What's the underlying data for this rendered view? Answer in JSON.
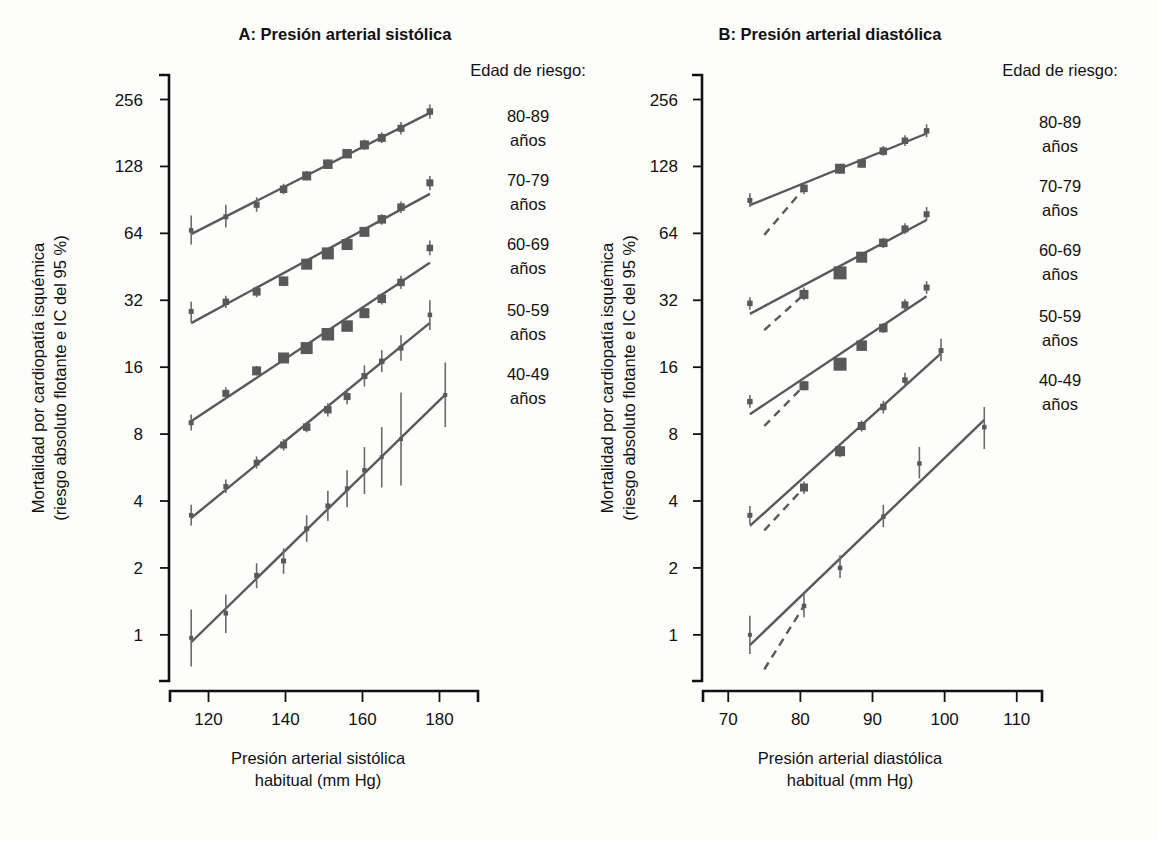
{
  "figure": {
    "background": "#fdfdfb",
    "marker_color": "#595959",
    "axis_color": "#111111"
  },
  "panels": [
    {
      "id": "A",
      "title": "A: Presión arterial sistólica",
      "xlabel_line1": "Presión arterial sistólica",
      "xlabel_line2": "habitual (mm Hg)",
      "ylabel_line1": "Mortalidad por cardiopatía isquémica",
      "ylabel_line2": "(riesgo absoluto flotante e IC del 95 %)",
      "legend_title": "Edad de riesgo:",
      "legend_items": [
        {
          "range": "80-89",
          "unit": "años"
        },
        {
          "range": "70-79",
          "unit": "años"
        },
        {
          "range": "60-69",
          "unit": "años"
        },
        {
          "range": "50-59",
          "unit": "años"
        },
        {
          "range": "40-49",
          "unit": "años"
        }
      ]
    },
    {
      "id": "B",
      "title": "B: Presión arterial diastólica",
      "xlabel_line1": "Presión arterial diastólica",
      "xlabel_line2": "habitual (mm Hg)",
      "ylabel_line1": "Mortalidad por cardiopatía isquémica",
      "ylabel_line2": "(riesgo absoluto flotante e IC del 95 %)",
      "legend_title": "Edad de riesgo:",
      "legend_items": [
        {
          "range": "80-89",
          "unit": "años"
        },
        {
          "range": "70-79",
          "unit": "años"
        },
        {
          "range": "60-69",
          "unit": "años"
        },
        {
          "range": "50-59",
          "unit": "años"
        },
        {
          "range": "40-49",
          "unit": "años"
        }
      ]
    }
  ],
  "chart_data": [
    {
      "type": "scatter",
      "panel": "A",
      "title": "A: Presión arterial sistólica",
      "xlabel": "Presión arterial sistólica habitual (mm Hg)",
      "ylabel": "Mortalidad por cardiopatía isquémica (riesgo absoluto flotante e IC del 95 %)",
      "xlim": [
        110,
        190
      ],
      "xticks": [
        120,
        140,
        160,
        180
      ],
      "ylim": [
        0.62,
        330
      ],
      "yscale": "log2",
      "yticks": [
        1,
        2,
        4,
        8,
        16,
        32,
        64,
        128,
        256
      ],
      "grid": false,
      "legend_position": "right",
      "series": [
        {
          "name": "80-89 años",
          "x": [
            115.5,
            124.5,
            132.5,
            139.5,
            145.5,
            151.0,
            156.0,
            160.5,
            165.0,
            170.0,
            177.5
          ],
          "y": [
            66,
            76,
            86,
            101,
            116,
            131,
            146,
            160,
            172,
            190,
            226
          ],
          "ci_low": [
            57,
            68,
            80,
            96,
            111,
            126,
            140,
            152,
            163,
            178,
            210
          ],
          "ci_high": [
            77,
            86,
            93,
            107,
            122,
            137,
            153,
            169,
            182,
            203,
            243
          ],
          "size": [
            4.5,
            5,
            6,
            7.5,
            9,
            9.5,
            9.5,
            9,
            8,
            7,
            6.5
          ]
        },
        {
          "name": "70-79 años",
          "x": [
            115.5,
            124.5,
            132.5,
            139.5,
            145.5,
            151.0,
            156.0,
            160.5,
            165.0,
            170.0,
            177.5
          ],
          "y": [
            28.5,
            31.5,
            35.0,
            39.0,
            46.5,
            52.0,
            57.0,
            65.0,
            74.0,
            84.0,
            108.0
          ],
          "ci_low": [
            25.5,
            29.5,
            33.0,
            37.0,
            44.5,
            50.0,
            55.0,
            62.0,
            70.0,
            79.0,
            100.0
          ],
          "ci_high": [
            31.5,
            33.5,
            37.0,
            41.0,
            48.5,
            54.5,
            59.5,
            68.0,
            78.0,
            89.0,
            116.0
          ],
          "size": [
            5,
            6.5,
            8,
            9.5,
            11,
            12,
            11,
            10,
            8.5,
            7.5,
            7
          ]
        },
        {
          "name": "60-69 años",
          "x": [
            115.5,
            124.5,
            132.5,
            139.5,
            145.5,
            151.0,
            156.0,
            160.5,
            165.0,
            170.0,
            177.5
          ],
          "y": [
            9.0,
            12.2,
            15.4,
            17.6,
            19.5,
            22.5,
            24.5,
            28.0,
            32.5,
            38.5,
            55.0
          ],
          "ci_low": [
            8.3,
            11.5,
            14.7,
            16.9,
            18.8,
            21.6,
            23.5,
            26.6,
            30.6,
            36.0,
            51.0
          ],
          "ci_high": [
            9.8,
            13.0,
            16.2,
            18.4,
            20.3,
            23.4,
            25.6,
            29.5,
            34.5,
            41.2,
            59.5
          ],
          "size": [
            5,
            7,
            9,
            11,
            12,
            12.5,
            11.5,
            10,
            8.5,
            7.5,
            6.5
          ]
        },
        {
          "name": "50-59 años",
          "x": [
            115.5,
            124.5,
            132.5,
            139.5,
            145.5,
            151.0,
            156.0,
            160.5,
            165.0,
            170.0,
            177.5
          ],
          "y": [
            3.45,
            4.65,
            5.95,
            7.15,
            8.6,
            10.3,
            11.8,
            14.6,
            17.0,
            19.5,
            27.5
          ],
          "ci_low": [
            3.1,
            4.35,
            5.6,
            6.75,
            8.15,
            9.6,
            10.9,
            13.1,
            15.2,
            17.1,
            23.5
          ],
          "ci_high": [
            3.85,
            5.0,
            6.35,
            7.6,
            9.1,
            11.0,
            12.8,
            16.3,
            19.1,
            22.3,
            32.0
          ],
          "size": [
            4.5,
            5,
            6,
            7,
            7.5,
            7.5,
            7,
            6,
            5.5,
            5,
            4.5
          ]
        },
        {
          "name": "40-49 años",
          "x": [
            115.5,
            124.5,
            132.5,
            139.5,
            145.5,
            151.0,
            156.0,
            160.5,
            165.0,
            170.0,
            181.5
          ],
          "y": [
            0.97,
            1.25,
            1.85,
            2.15,
            3.0,
            3.8,
            4.55,
            5.5,
            6.3,
            7.6,
            12.0
          ],
          "ci_low": [
            0.72,
            1.02,
            1.62,
            1.88,
            2.62,
            3.25,
            3.75,
            4.3,
            4.6,
            4.7,
            8.6
          ],
          "ci_high": [
            1.3,
            1.52,
            2.1,
            2.45,
            3.45,
            4.45,
            5.5,
            7.0,
            8.6,
            12.3,
            16.8
          ],
          "size": [
            4,
            4.5,
            5,
            5,
            5,
            5,
            4.5,
            4.5,
            4,
            4,
            4
          ]
        }
      ]
    },
    {
      "type": "scatter",
      "panel": "B",
      "title": "B: Presión arterial diastólica",
      "xlabel": "Presión arterial diastólica habitual (mm Hg)",
      "ylabel": "Mortalidad por cardiopatía isquémica (riesgo absoluto flotante e IC del 95 %)",
      "xlim": [
        66.5,
        113.5
      ],
      "xticks": [
        70,
        80,
        90,
        100,
        110
      ],
      "ylim": [
        0.62,
        330
      ],
      "yscale": "log2",
      "yticks": [
        1,
        2,
        4,
        8,
        16,
        32,
        64,
        128,
        256
      ],
      "grid": false,
      "legend_position": "right",
      "series": [
        {
          "name": "80-89 años",
          "x": [
            73.0,
            80.5,
            85.5,
            88.5,
            91.5,
            94.5,
            97.5
          ],
          "y": [
            90,
            102,
            125,
            132,
            150,
            167,
            185
          ],
          "ci_low": [
            84,
            96,
            119,
            126,
            143,
            158,
            173
          ],
          "ci_high": [
            97,
            109,
            131,
            139,
            158,
            177,
            198
          ],
          "size": [
            5,
            7.5,
            10,
            8.5,
            7.5,
            6.5,
            5.5
          ],
          "dash_from": [
            75.0,
            63
          ],
          "dash_to": [
            80.5,
            102
          ]
        },
        {
          "name": "70-79 años",
          "x": [
            73.0,
            80.5,
            85.5,
            88.5,
            91.5,
            94.5,
            97.5
          ],
          "y": [
            31.0,
            34.0,
            42.5,
            50.0,
            58.0,
            67.0,
            78.0
          ],
          "ci_low": [
            29.0,
            32.0,
            40.5,
            47.5,
            55.0,
            63.5,
            73.0
          ],
          "ci_high": [
            33.0,
            36.5,
            45.0,
            52.5,
            61.0,
            71.0,
            84.0
          ],
          "size": [
            5.5,
            9,
            13,
            11,
            8.5,
            7,
            6
          ],
          "dash_from": [
            75.0,
            23.5
          ],
          "dash_to": [
            80.5,
            34.0
          ]
        },
        {
          "name": "60-69 años",
          "x": [
            73.0,
            80.5,
            85.5,
            88.5,
            91.5,
            94.5,
            97.5
          ],
          "y": [
            11.2,
            13.2,
            16.5,
            20.0,
            24.0,
            30.5,
            36.5
          ],
          "ci_low": [
            10.5,
            12.6,
            15.8,
            19.1,
            22.8,
            28.8,
            34.2
          ],
          "ci_high": [
            12.0,
            13.9,
            17.3,
            21.0,
            25.3,
            32.3,
            39.0
          ],
          "size": [
            5.5,
            9,
            13,
            10.5,
            8.5,
            7,
            6
          ],
          "dash_from": [
            75.0,
            8.7
          ],
          "dash_to": [
            80.5,
            13.2
          ]
        },
        {
          "name": "50-59 años",
          "x": [
            73.0,
            80.5,
            85.5,
            88.5,
            91.5,
            94.5,
            99.5
          ],
          "y": [
            3.45,
            4.6,
            6.7,
            8.7,
            10.6,
            14.0,
            19.0
          ],
          "ci_low": [
            3.15,
            4.3,
            6.3,
            8.2,
            9.9,
            13.0,
            17.0
          ],
          "ci_high": [
            3.8,
            4.9,
            7.1,
            9.2,
            11.3,
            15.1,
            21.5
          ],
          "size": [
            5,
            8,
            10,
            8,
            6.5,
            5.5,
            5
          ],
          "dash_from": [
            75.0,
            2.95
          ],
          "dash_to": [
            80.5,
            4.6
          ]
        },
        {
          "name": "40-49 años",
          "x": [
            73.0,
            80.5,
            85.5,
            91.5,
            96.5,
            105.5
          ],
          "y": [
            1.0,
            1.35,
            2.0,
            3.4,
            5.9,
            8.6
          ],
          "ci_low": [
            0.82,
            1.2,
            1.8,
            3.05,
            5.05,
            6.85
          ],
          "ci_high": [
            1.22,
            1.55,
            2.28,
            3.85,
            7.0,
            10.6
          ],
          "size": [
            4,
            4.5,
            4.5,
            4.5,
            4.5,
            4.5
          ],
          "dash_from": [
            75.0,
            0.7
          ],
          "dash_to": [
            80.5,
            1.35
          ]
        }
      ]
    }
  ]
}
